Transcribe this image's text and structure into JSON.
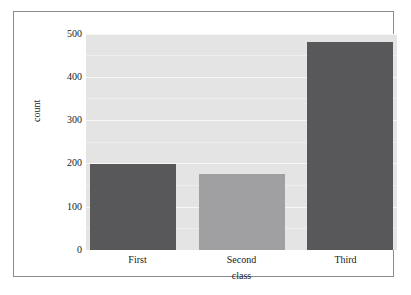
{
  "chart_data": {
    "type": "bar",
    "title": "",
    "subtitle": "",
    "categories": [
      "First",
      "Second",
      "Third"
    ],
    "values": [
      204,
      180,
      491
    ],
    "xlabel": "class",
    "ylabel": "count",
    "ylim": [
      0,
      510
    ],
    "yticks": [
      0,
      100,
      200,
      300,
      400,
      500
    ],
    "ytick_labels": [
      "0",
      "100",
      "200",
      "300",
      "400",
      "500"
    ],
    "grid": true,
    "legend": "none",
    "bar_colors": [
      "#58585b",
      "#a0a0a2",
      "#58585b"
    ],
    "panel_background": "#e4e4e4",
    "gridline_color": "#f7f7f7",
    "frame_border_color": "#8a8a92",
    "figure_background": "#ffffff"
  }
}
